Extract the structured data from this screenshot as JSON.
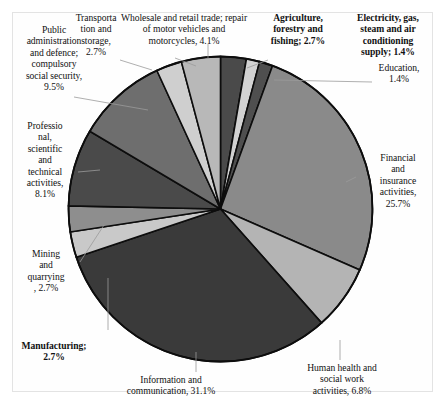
{
  "chart_data": {
    "type": "pie",
    "title": "",
    "subtitle": "",
    "xlabel": "",
    "ylabel": "",
    "legend_position": "none",
    "grid": false,
    "labels_outside": true,
    "units": "percent",
    "total": 100.0,
    "categories": [
      "Agriculture, forestry and fishing",
      "Electricity, gas, steam and air conditioning supply",
      "Education",
      "Financial and insurance activities",
      "Human health and social work activities",
      "Information and communication",
      "Manufacturing",
      "Mining and quarrying",
      "Professional, scientific and technical activities",
      "Public administration and defence; compulsory social security",
      "Transportation and storage",
      "Wholesale and retail trade; repair of motor vehicles and motorcycles"
    ],
    "values": [
      2.7,
      1.4,
      1.4,
      25.7,
      6.8,
      31.1,
      2.7,
      2.7,
      8.1,
      9.5,
      2.7,
      4.1
    ],
    "colors": [
      "#4a4a4a",
      "#d2d2d2",
      "#4f4f4f",
      "#8a8a8a",
      "#b4b4b4",
      "#3a3a3a",
      "#c9c9c9",
      "#8e8e8e",
      "#4a4a4a",
      "#6e6e6e",
      "#cfcfcf",
      "#b8b8b8"
    ],
    "slices": [
      {
        "label": "Agriculture, forestry and fishing",
        "value": 2.7,
        "value_text": "2.7%",
        "color": "#4a4a4a"
      },
      {
        "label": "Electricity, gas, steam and air conditioning supply",
        "value": 1.4,
        "value_text": "1.4%",
        "color": "#d2d2d2"
      },
      {
        "label": "Education",
        "value": 1.4,
        "value_text": "1.4%",
        "color": "#4f4f4f"
      },
      {
        "label": "Financial and insurance activities",
        "value": 25.7,
        "value_text": "25.7%",
        "color": "#8a8a8a"
      },
      {
        "label": "Human health and social work activities",
        "value": 6.8,
        "value_text": "6.8%",
        "color": "#b4b4b4"
      },
      {
        "label": "Information and communication",
        "value": 31.1,
        "value_text": "31.1%",
        "color": "#3a3a3a"
      },
      {
        "label": "Manufacturing",
        "value": 2.7,
        "value_text": "2.7%",
        "color": "#c9c9c9"
      },
      {
        "label": "Mining and quarrying",
        "value": 2.7,
        "value_text": "2.7%",
        "color": "#8e8e8e"
      },
      {
        "label": "Professional, scientific and technical activities",
        "value": 8.1,
        "value_text": "8.1%",
        "color": "#4a4a4a"
      },
      {
        "label": "Public administration and defence; compulsory social security",
        "value": 9.5,
        "value_text": "9.5%",
        "color": "#6e6e6e"
      },
      {
        "label": "Transportation and storage",
        "value": 2.7,
        "value_text": "2.7%",
        "color": "#cfcfcf"
      },
      {
        "label": "Wholesale and retail trade; repair of motor vehicles and motorcycles",
        "value": 4.1,
        "value_text": "4.1%",
        "color": "#b8b8b8"
      }
    ]
  },
  "labels": {
    "public_administration": "Public\nadministration\nand defence;\ncompulsory\nsocial security,\n9.5%",
    "transportation": "Transporta\ntion and\nstorage,\n2.7%",
    "wholesale": "Wholesale and retail trade; repair\nof motor vehicles and\nmotorcycles, 4.1%",
    "agriculture": "Agriculture,\nforestry and\nfishing; 2.7%",
    "electricity": "Electricity, gas,\nsteam and air\nconditioning\nsupply; 1.4%",
    "education": "Education,\n1.4%",
    "financial": "Financial\nand\ninsurance\nactivities,\n25.7%",
    "professional": "Professio\nnal,\nscientific\nand\ntechnical\nactivities,\n8.1%",
    "mining": "Mining\nand\nquarrying\n, 2.7%",
    "manufacturing": "Manufacturing;\n2.7%",
    "information": "Information and\ncommunication, 31.1%",
    "human_health": "Human health and\nsocial work\nactivities, 6.8%"
  }
}
